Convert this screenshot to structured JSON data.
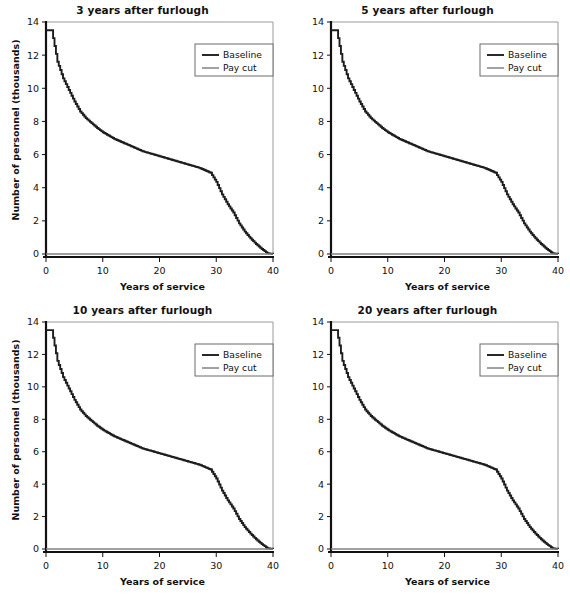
{
  "figure": {
    "panel_order": [
      "p3",
      "p5",
      "p10",
      "p20"
    ]
  },
  "axis": {
    "xlabel": "Years of service",
    "ylabel": "Number of personnel (thousands)",
    "xticks": [
      "0",
      "10",
      "20",
      "30",
      "40"
    ],
    "yticks": [
      "0",
      "2",
      "4",
      "6",
      "8",
      "10",
      "12",
      "14"
    ],
    "xlim": [
      0,
      40
    ],
    "ylim": [
      0,
      14
    ]
  },
  "legend": {
    "entries": [
      {
        "label": "Baseline",
        "color": "#1d1d1d",
        "width": 1.9
      },
      {
        "label": "Pay cut",
        "color": "#6e6e6e",
        "width": 1.3
      }
    ],
    "position": "top-right"
  },
  "colors": {
    "baseline": "#1d1d1d",
    "paycut": "#808080",
    "axis": "#111111",
    "frame": "#9a9a9a",
    "background": "#ffffff"
  },
  "titles": {
    "p3": "3 years after furlough",
    "p5": "5 years after furlough",
    "p10": "10 years after furlough",
    "p20": "20 years after furlough"
  },
  "chart_data": [
    {
      "id": "p3",
      "type": "line",
      "title": "3 years after furlough",
      "xlabel": "Years of service",
      "ylabel": "Number of personnel (thousands)",
      "xlim": [
        0,
        40
      ],
      "ylim": [
        0,
        14
      ],
      "xticks": [
        0,
        10,
        20,
        30,
        40
      ],
      "yticks": [
        0,
        2,
        4,
        6,
        8,
        10,
        12,
        14
      ],
      "grid": false,
      "legend": [
        "Baseline",
        "Pay cut"
      ],
      "x": [
        0,
        1,
        2,
        3,
        4,
        5,
        6,
        7,
        8,
        9,
        10,
        11,
        12,
        13,
        14,
        15,
        16,
        17,
        18,
        19,
        20,
        21,
        22,
        23,
        24,
        25,
        26,
        27,
        28,
        29,
        30,
        31,
        32,
        33,
        34,
        35,
        36,
        37,
        38,
        39,
        40
      ],
      "series": [
        {
          "name": "Baseline",
          "values": [
            13.5,
            13.5,
            11.6,
            10.6,
            9.9,
            9.2,
            8.6,
            8.2,
            7.9,
            7.6,
            7.35,
            7.15,
            6.95,
            6.8,
            6.65,
            6.5,
            6.35,
            6.2,
            6.1,
            6.0,
            5.9,
            5.8,
            5.7,
            5.6,
            5.5,
            5.4,
            5.3,
            5.2,
            5.05,
            4.9,
            4.35,
            3.6,
            3.0,
            2.5,
            1.85,
            1.35,
            0.95,
            0.6,
            0.3,
            0.05,
            0.0
          ]
        },
        {
          "name": "Pay cut",
          "values": [
            0,
            0,
            0,
            0,
            0,
            0,
            0,
            0,
            0,
            0,
            0,
            0,
            0,
            0,
            0,
            0,
            0,
            0,
            0,
            0,
            0,
            0,
            0,
            0,
            0,
            0,
            0,
            0,
            0,
            0,
            0,
            0,
            0,
            0,
            0,
            0,
            0,
            0,
            0,
            0,
            0
          ]
        }
      ]
    },
    {
      "id": "p5",
      "type": "line",
      "title": "5 years after furlough",
      "xlabel": "Years of service",
      "ylabel": "Number of personnel (thousands)",
      "xlim": [
        0,
        40
      ],
      "ylim": [
        0,
        14
      ],
      "xticks": [
        0,
        10,
        20,
        30,
        40
      ],
      "yticks": [
        0,
        2,
        4,
        6,
        8,
        10,
        12,
        14
      ],
      "grid": false,
      "legend": [
        "Baseline",
        "Pay cut"
      ],
      "x": [
        0,
        1,
        2,
        3,
        4,
        5,
        6,
        7,
        8,
        9,
        10,
        11,
        12,
        13,
        14,
        15,
        16,
        17,
        18,
        19,
        20,
        21,
        22,
        23,
        24,
        25,
        26,
        27,
        28,
        29,
        30,
        31,
        32,
        33,
        34,
        35,
        36,
        37,
        38,
        39,
        40
      ],
      "series": [
        {
          "name": "Baseline",
          "values": [
            13.5,
            13.5,
            11.6,
            10.6,
            9.9,
            9.2,
            8.6,
            8.2,
            7.9,
            7.6,
            7.35,
            7.15,
            6.95,
            6.8,
            6.65,
            6.5,
            6.35,
            6.2,
            6.1,
            6.0,
            5.9,
            5.8,
            5.7,
            5.6,
            5.5,
            5.4,
            5.3,
            5.2,
            5.05,
            4.9,
            4.35,
            3.6,
            3.0,
            2.5,
            1.85,
            1.35,
            0.95,
            0.6,
            0.3,
            0.05,
            0.0
          ]
        },
        {
          "name": "Pay cut",
          "values": [
            0,
            0,
            0,
            0,
            0,
            0,
            0,
            0,
            0,
            0,
            0,
            0,
            0,
            0,
            0,
            0,
            0,
            0,
            0,
            0,
            0,
            0,
            0,
            0,
            0,
            0,
            0,
            0,
            0,
            0,
            0,
            0,
            0,
            0,
            0,
            0,
            0,
            0,
            0,
            0,
            0
          ]
        }
      ]
    },
    {
      "id": "p10",
      "type": "line",
      "title": "10 years after furlough",
      "xlabel": "Years of service",
      "ylabel": "Number of personnel (thousands)",
      "xlim": [
        0,
        40
      ],
      "ylim": [
        0,
        14
      ],
      "xticks": [
        0,
        10,
        20,
        30,
        40
      ],
      "yticks": [
        0,
        2,
        4,
        6,
        8,
        10,
        12,
        14
      ],
      "grid": false,
      "legend": [
        "Baseline",
        "Pay cut"
      ],
      "x": [
        0,
        1,
        2,
        3,
        4,
        5,
        6,
        7,
        8,
        9,
        10,
        11,
        12,
        13,
        14,
        15,
        16,
        17,
        18,
        19,
        20,
        21,
        22,
        23,
        24,
        25,
        26,
        27,
        28,
        29,
        30,
        31,
        32,
        33,
        34,
        35,
        36,
        37,
        38,
        39,
        40
      ],
      "series": [
        {
          "name": "Baseline",
          "values": [
            13.5,
            13.5,
            11.6,
            10.6,
            9.9,
            9.2,
            8.6,
            8.2,
            7.9,
            7.6,
            7.35,
            7.15,
            6.95,
            6.8,
            6.65,
            6.5,
            6.35,
            6.2,
            6.1,
            6.0,
            5.9,
            5.8,
            5.7,
            5.6,
            5.5,
            5.4,
            5.3,
            5.2,
            5.05,
            4.9,
            4.35,
            3.6,
            3.0,
            2.5,
            1.85,
            1.35,
            0.95,
            0.6,
            0.3,
            0.05,
            0.0
          ]
        },
        {
          "name": "Pay cut",
          "values": [
            0,
            0,
            0,
            0,
            0,
            0,
            0,
            0,
            0,
            0,
            0,
            0,
            0,
            0,
            0,
            0,
            0,
            0,
            0,
            0,
            0,
            0,
            0,
            0,
            0,
            0,
            0,
            0,
            0,
            0,
            0,
            0,
            0,
            0,
            0,
            0,
            0,
            0,
            0,
            0,
            0
          ]
        }
      ]
    },
    {
      "id": "p20",
      "type": "line",
      "title": "20 years after furlough",
      "xlabel": "Years of service",
      "ylabel": "Number of personnel (thousands)",
      "xlim": [
        0,
        40
      ],
      "ylim": [
        0,
        14
      ],
      "xticks": [
        0,
        10,
        20,
        30,
        40
      ],
      "yticks": [
        0,
        2,
        4,
        6,
        8,
        10,
        12,
        14
      ],
      "grid": false,
      "legend": [
        "Baseline",
        "Pay cut"
      ],
      "x": [
        0,
        1,
        2,
        3,
        4,
        5,
        6,
        7,
        8,
        9,
        10,
        11,
        12,
        13,
        14,
        15,
        16,
        17,
        18,
        19,
        20,
        21,
        22,
        23,
        24,
        25,
        26,
        27,
        28,
        29,
        30,
        31,
        32,
        33,
        34,
        35,
        36,
        37,
        38,
        39,
        40
      ],
      "series": [
        {
          "name": "Baseline",
          "values": [
            13.5,
            13.5,
            11.6,
            10.6,
            9.9,
            9.2,
            8.6,
            8.2,
            7.9,
            7.6,
            7.35,
            7.15,
            6.95,
            6.8,
            6.65,
            6.5,
            6.35,
            6.2,
            6.1,
            6.0,
            5.9,
            5.8,
            5.7,
            5.6,
            5.5,
            5.4,
            5.3,
            5.2,
            5.05,
            4.9,
            4.35,
            3.6,
            3.0,
            2.5,
            1.85,
            1.35,
            0.95,
            0.6,
            0.3,
            0.05,
            0.0
          ]
        },
        {
          "name": "Pay cut",
          "values": [
            0,
            0,
            0,
            0,
            0,
            0,
            0,
            0,
            0,
            0,
            0,
            0,
            0,
            0,
            0,
            0,
            0,
            0,
            0,
            0,
            0,
            0,
            0,
            0,
            0,
            0,
            0,
            0,
            0,
            0,
            0,
            0,
            0,
            0,
            0,
            0,
            0,
            0,
            0,
            0,
            0
          ]
        }
      ]
    }
  ]
}
